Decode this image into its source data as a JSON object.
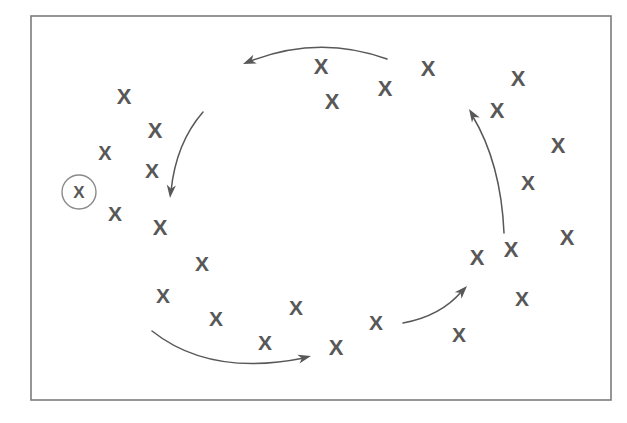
{
  "figure": {
    "width": 627,
    "height": 423,
    "background_color": "#ffffff",
    "mark_glyph": "X",
    "mark_color": "#585858",
    "frame": {
      "label": "diagram-border",
      "x": 31,
      "y": 16,
      "width": 580,
      "height": 384,
      "stroke_color": "#7c7c7c",
      "stroke_width": 1.6
    },
    "highlight": {
      "label": "circled-x-marker",
      "cx": 79,
      "cy": 192,
      "r": 17,
      "stroke_color": "#8a8a8a",
      "mark_size": 17
    },
    "marks": [
      {
        "id": "x-01",
        "cx": 124,
        "cy": 96,
        "size": 22,
        "rotate": 0
      },
      {
        "id": "x-02",
        "cx": 155,
        "cy": 130,
        "size": 22,
        "rotate": 0
      },
      {
        "id": "x-03",
        "cx": 105,
        "cy": 153,
        "size": 20,
        "rotate": 0
      },
      {
        "id": "x-04",
        "cx": 152,
        "cy": 170,
        "size": 21,
        "rotate": 0
      },
      {
        "id": "x-05",
        "cx": 115,
        "cy": 213,
        "size": 21,
        "rotate": 0
      },
      {
        "id": "x-06",
        "cx": 160,
        "cy": 227,
        "size": 22,
        "rotate": 0
      },
      {
        "id": "x-07",
        "cx": 202,
        "cy": 263,
        "size": 21,
        "rotate": 0
      },
      {
        "id": "x-08",
        "cx": 163,
        "cy": 295,
        "size": 21,
        "rotate": 0
      },
      {
        "id": "x-09",
        "cx": 216,
        "cy": 318,
        "size": 21,
        "rotate": 0
      },
      {
        "id": "x-10",
        "cx": 265,
        "cy": 342,
        "size": 21,
        "rotate": 0
      },
      {
        "id": "x-11",
        "cx": 296,
        "cy": 307,
        "size": 21,
        "rotate": 0
      },
      {
        "id": "x-12",
        "cx": 336,
        "cy": 347,
        "size": 22,
        "rotate": 0
      },
      {
        "id": "x-13",
        "cx": 376,
        "cy": 322,
        "size": 21,
        "rotate": 0
      },
      {
        "id": "x-14",
        "cx": 459,
        "cy": 334,
        "size": 21,
        "rotate": 0
      },
      {
        "id": "x-15",
        "cx": 522,
        "cy": 298,
        "size": 21,
        "rotate": 0
      },
      {
        "id": "x-16",
        "cx": 477,
        "cy": 257,
        "size": 22,
        "rotate": 0
      },
      {
        "id": "x-17",
        "cx": 511,
        "cy": 249,
        "size": 22,
        "rotate": 0
      },
      {
        "id": "x-18",
        "cx": 567,
        "cy": 237,
        "size": 22,
        "rotate": 0
      },
      {
        "id": "x-19",
        "cx": 528,
        "cy": 182,
        "size": 21,
        "rotate": 0
      },
      {
        "id": "x-20",
        "cx": 558,
        "cy": 145,
        "size": 22,
        "rotate": 0
      },
      {
        "id": "x-21",
        "cx": 497,
        "cy": 110,
        "size": 22,
        "rotate": 0
      },
      {
        "id": "x-22",
        "cx": 518,
        "cy": 78,
        "size": 22,
        "rotate": 0
      },
      {
        "id": "x-23",
        "cx": 428,
        "cy": 68,
        "size": 22,
        "rotate": 0
      },
      {
        "id": "x-24",
        "cx": 385,
        "cy": 88,
        "size": 22,
        "rotate": 0
      },
      {
        "id": "x-25",
        "cx": 321,
        "cy": 66,
        "size": 22,
        "rotate": 0
      },
      {
        "id": "x-26",
        "cx": 332,
        "cy": 101,
        "size": 22,
        "rotate": 0
      }
    ],
    "arrows": [
      {
        "id": "arrow-top-leftward",
        "label": "top-arrow-pointing-left",
        "path": "M 387 59 Q 318 34 248 62",
        "head_x": 243,
        "head_y": 64,
        "head_angle": 158
      },
      {
        "id": "arrow-left-downward",
        "label": "left-arrow-pointing-down",
        "path": "M 203 112 Q 176 143 171 191",
        "head_x": 170,
        "head_y": 198,
        "head_angle": 96
      },
      {
        "id": "arrow-bottom-rightward",
        "label": "bottom-arrow-pointing-right",
        "path": "M 152 331 Q 210 377 304 358",
        "head_x": 311,
        "head_y": 356,
        "head_angle": -14
      },
      {
        "id": "arrow-lower-right-upward",
        "label": "lower-right-arrow-pointing-up-right",
        "path": "M 403 323 Q 441 316 462 291",
        "head_x": 467,
        "head_y": 286,
        "head_angle": -47
      },
      {
        "id": "arrow-right-upward",
        "label": "right-arrow-pointing-up",
        "path": "M 504 233 Q 501 163 472 115",
        "head_x": 469,
        "head_y": 109,
        "head_angle": -122
      }
    ]
  }
}
